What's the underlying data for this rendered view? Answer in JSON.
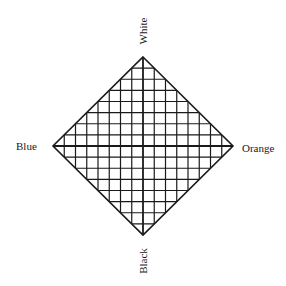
{
  "diagram": {
    "type": "color-space diamond",
    "labels": {
      "top": "White",
      "bottom": "Black",
      "left": "Blue",
      "right": "Orange"
    },
    "geometry": {
      "center": [
        143,
        146
      ],
      "half_width": 90,
      "half_height": 89,
      "grid_divisions_per_half": 8
    },
    "colors": {
      "line": "#1a1a1a",
      "background": "#ffffff"
    }
  }
}
